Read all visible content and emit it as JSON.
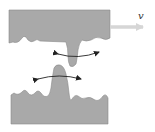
{
  "diagram": {
    "velocity_label": "v",
    "colors": {
      "material": "#a9a9a9",
      "outline": "#555555",
      "arrow": "#222222",
      "velocity_arrow": "#d6d6d6",
      "background": "#ffffff"
    },
    "elements": [
      {
        "name": "top-surface",
        "description": "Upper block with rough bottom edge and a downward asperity"
      },
      {
        "name": "bottom-surface",
        "description": "Lower block with rough top edge and an upward asperity"
      },
      {
        "name": "velocity-arrow",
        "label": "v",
        "direction": "right"
      },
      {
        "name": "upper-double-arrow",
        "description": "Curved double-headed arrow across top asperity"
      },
      {
        "name": "lower-double-arrow",
        "description": "Curved double-headed arrow across bottom asperity"
      }
    ]
  }
}
